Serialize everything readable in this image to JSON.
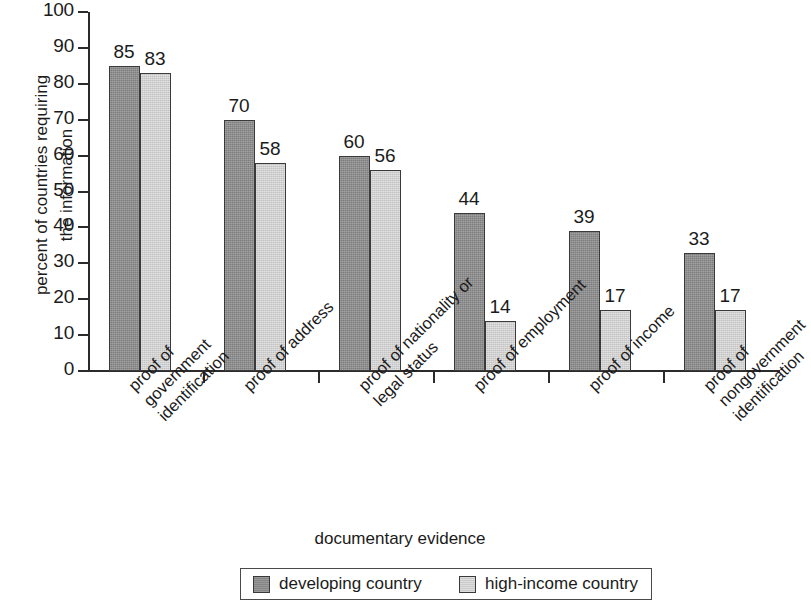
{
  "chart_data": {
    "type": "bar",
    "title": "",
    "xlabel": "documentary evidence",
    "ylabel": "percent of countries requiring the information",
    "ylabel_lines": [
      "percent of countries requiring",
      "the information"
    ],
    "categories": [
      "proof of government identification",
      "proof of address",
      "proof of nationality or legal status",
      "proof of employment",
      "proof of income",
      "proof of nongovernment identification"
    ],
    "category_lines": [
      [
        "proof of",
        "government",
        "identification"
      ],
      [
        "proof of address"
      ],
      [
        "proof of nationality or",
        "legal status"
      ],
      [
        "proof of employment"
      ],
      [
        "proof of income"
      ],
      [
        "proof of",
        "nongovernment",
        "identification"
      ]
    ],
    "series": [
      {
        "name": "developing country",
        "key": "developing",
        "color": "#8d8d8d",
        "values": [
          85,
          70,
          60,
          44,
          39,
          33
        ]
      },
      {
        "name": "high-income country",
        "key": "highincome",
        "color": "#d6d6d6",
        "values": [
          83,
          58,
          56,
          14,
          17,
          17
        ]
      }
    ],
    "ylim": [
      0,
      100
    ],
    "yticks": [
      0,
      10,
      20,
      30,
      40,
      50,
      60,
      70,
      80,
      90,
      100
    ],
    "ytick_labels": [
      "0",
      "10",
      "20",
      "30",
      "40",
      "50",
      "60",
      "70",
      "80",
      "90",
      "100"
    ],
    "grid": false,
    "legend_position": "bottom",
    "data_labels": true
  }
}
